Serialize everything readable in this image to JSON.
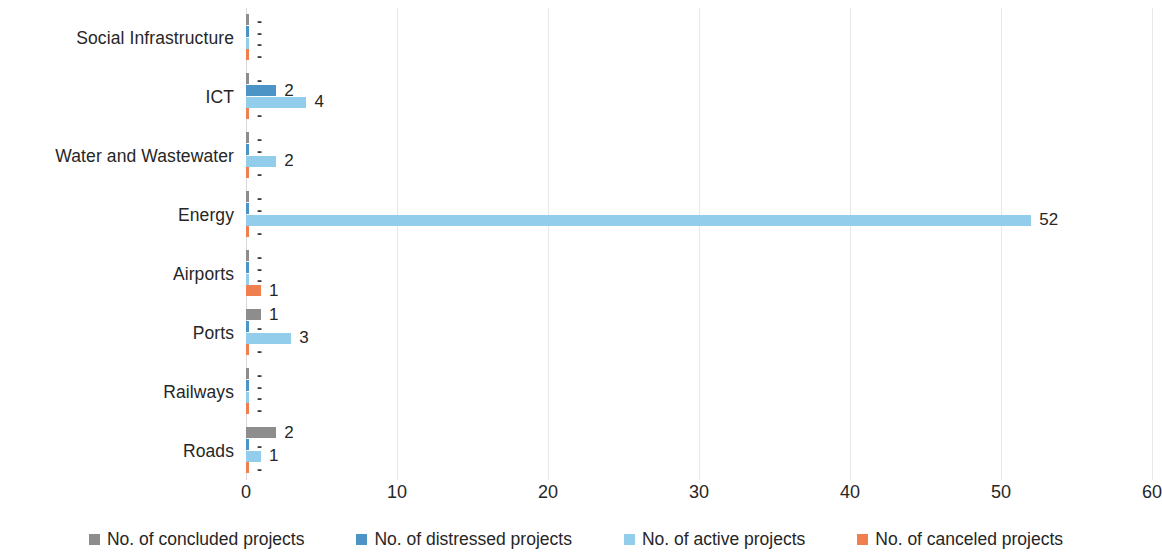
{
  "chart_data": {
    "type": "bar",
    "orientation": "horizontal",
    "title": "",
    "xlabel": "",
    "ylabel": "",
    "xlim": [
      0,
      60
    ],
    "xticks": [
      "0",
      "10",
      "20",
      "30",
      "40",
      "50",
      "60"
    ],
    "grid": "vertical",
    "legend_position": "bottom",
    "categories": [
      "Social Infrastructure",
      "ICT",
      "Water and Wastewater",
      "Energy",
      "Airports",
      "Ports",
      "Railways",
      "Roads"
    ],
    "series": [
      {
        "name": "No. of concluded projects",
        "color": "#8d8d8d",
        "values": [
          0,
          0,
          0,
          0,
          0,
          1,
          0,
          2
        ],
        "labels": [
          "-",
          "-",
          "-",
          "-",
          "-",
          "1",
          "-",
          "2"
        ]
      },
      {
        "name": "No. of distressed projects",
        "color": "#4d94c6",
        "values": [
          0,
          2,
          0,
          0,
          0,
          0,
          0,
          0
        ],
        "labels": [
          "-",
          "2",
          "-",
          "-",
          "-",
          "-",
          "-",
          "-"
        ]
      },
      {
        "name": "No. of active projects",
        "color": "#92cdeb",
        "values": [
          0,
          4,
          2,
          52,
          0,
          3,
          0,
          1
        ],
        "labels": [
          "-",
          "4",
          "2",
          "52",
          "-",
          "3",
          "-",
          "1"
        ]
      },
      {
        "name": "No. of canceled projects",
        "color": "#ef7f4e",
        "values": [
          0,
          0,
          0,
          0,
          1,
          0,
          0,
          0
        ],
        "labels": [
          "-",
          "-",
          "-",
          "-",
          "1",
          "-",
          "-",
          "-"
        ]
      }
    ]
  },
  "legend": {
    "items": [
      {
        "label": "No. of concluded projects",
        "color": "#8d8d8d"
      },
      {
        "label": "No. of distressed projects",
        "color": "#4d94c6"
      },
      {
        "label": "No. of active projects",
        "color": "#92cdeb"
      },
      {
        "label": "No. of canceled projects",
        "color": "#ef7f4e"
      }
    ]
  }
}
